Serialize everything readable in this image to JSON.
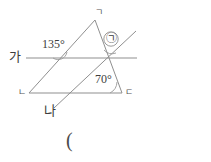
{
  "figure": {
    "background_color": "#ffffff",
    "stroke_color": "#8a8a8a",
    "stroke_width": 1,
    "lines": {
      "line_ga": {
        "name": "가",
        "label": "가",
        "x1": 26,
        "y1": 58,
        "x2": 137,
        "y2": 58
      },
      "line_na": {
        "name": "나",
        "label": "나",
        "x1": 54,
        "y1": 108,
        "x2": 136,
        "y2": 31
      },
      "triangle": {
        "vertices": [
          {
            "label": "ㄱ",
            "x": 95,
            "y": 20
          },
          {
            "label": "ㄴ",
            "x": 29,
            "y": 93
          },
          {
            "label": "ㄷ",
            "x": 122,
            "y": 93
          }
        ]
      }
    },
    "angles": [
      {
        "name": "angle-135",
        "value": "135",
        "unit": "°",
        "label": "135°"
      },
      {
        "name": "angle-70",
        "value": "70",
        "unit": "°",
        "label": "70°"
      },
      {
        "name": "angle-unknown",
        "label": "㉠"
      }
    ],
    "vertex_labels": {
      "top": "ㄱ",
      "bottom_left": "ㄴ",
      "bottom_right": "ㄷ"
    },
    "line_labels": {
      "horizontal": "가",
      "diagonal": "나"
    },
    "caption": "("
  }
}
